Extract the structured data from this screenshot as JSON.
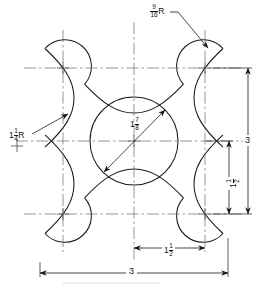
{
  "drawing": {
    "title": "Four-lobed plate with central hole",
    "line_color": "#1a1a1a",
    "center_line_color": "#666666",
    "background": "#ffffff"
  },
  "labels": {
    "corner_radius": {
      "whole": "",
      "num": "9",
      "den": "16",
      "suffix": "R"
    },
    "fillet_radius": {
      "whole": "1",
      "num": "1",
      "den": "4",
      "suffix": "R"
    },
    "hole_diameter": {
      "whole": "1",
      "num": "7",
      "den": "8",
      "suffix": ""
    }
  },
  "dimensions": {
    "bottom_overall": {
      "value": "3"
    },
    "bottom_inner": {
      "whole": "1",
      "num": "1",
      "den": "2"
    },
    "right_overall": {
      "value": "3"
    },
    "right_inner": {
      "whole": "1",
      "num": "1",
      "den": "2"
    }
  },
  "footer": {
    "caption": ""
  }
}
